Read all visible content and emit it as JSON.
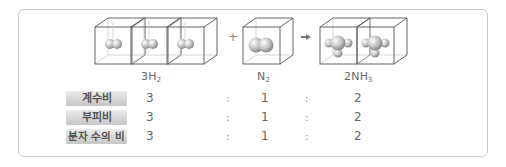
{
  "diagram": {
    "title": "",
    "reactants": [
      {
        "formula_main": "3H",
        "formula_sub": "2",
        "molecule_count": 3,
        "molecule_icon": "h2-molecule-icon"
      },
      {
        "formula_main": "N",
        "formula_sub": "2",
        "molecule_count": 1,
        "molecule_icon": "n2-molecule-icon"
      }
    ],
    "product": {
      "formula_main": "2NH",
      "formula_sub": "3",
      "molecule_count": 2,
      "molecule_icon": "nh3-molecule-icon"
    },
    "plus_symbol": "+",
    "arrow_symbol": "→"
  },
  "ratio_table": {
    "rows": [
      {
        "label": "계수비",
        "values": [
          "3",
          "1",
          "2"
        ]
      },
      {
        "label": "부피비",
        "values": [
          "3",
          "1",
          "2"
        ]
      },
      {
        "label": "분자 수의 비",
        "values": [
          "3",
          "1",
          "2"
        ]
      }
    ],
    "separator": ":"
  },
  "colors": {
    "cube_edge": "#555555",
    "cube_hidden_edge": "#bbbbbb",
    "border": "#c9c9c9",
    "badge_gradient_top": "#ececec",
    "badge_gradient_bottom": "#c6c6c6",
    "text": "#666666"
  }
}
